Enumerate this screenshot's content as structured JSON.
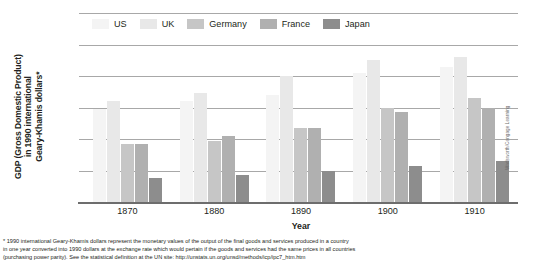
{
  "chart_data": {
    "type": "bar",
    "title": "",
    "xlabel": "Year",
    "ylabel": "GDP (Gross Domestic Product) in 1990 international Geary-Khamis dollars*",
    "categories": [
      "1870",
      "1880",
      "1890",
      "1900",
      "1910"
    ],
    "ylim": [
      0,
      6000
    ],
    "yticks": [
      "0",
      "1000",
      "2000",
      "3000",
      "4000",
      "5000",
      "6000"
    ],
    "grid": true,
    "legend_position": "top",
    "series": [
      {
        "name": "US",
        "color": "#f4f4f4",
        "values": [
          2950,
          3200,
          3400,
          4100,
          4300
        ]
      },
      {
        "name": "UK",
        "color": "#e8e8e8",
        "values": [
          3200,
          3450,
          4000,
          4500,
          4600
        ]
      },
      {
        "name": "Germany",
        "color": "#c6c6c6",
        "values": [
          1850,
          1950,
          2350,
          3000,
          3300
        ]
      },
      {
        "name": "France",
        "color": "#b0b0b0",
        "values": [
          1850,
          2100,
          2350,
          2850,
          3000
        ]
      },
      {
        "name": "Japan",
        "color": "#8d8d8d",
        "values": [
          750,
          850,
          1000,
          1150,
          1300
        ]
      }
    ]
  },
  "axis": {
    "y_title": "GDP (Gross Domestic Product)\nin 1990 international\nGeary-Khamis dollars*",
    "y_title_line1": "GDP (Gross Domestic Product)",
    "y_title_line2": "in 1990 international",
    "y_title_line3": "Geary-Khamis dollars*",
    "x_title": "Year"
  },
  "footnote": {
    "line1": "* 1990 international Geary-Khamis dollars represent the monetary values of the output of the final goods and services produced in a country",
    "line2": "in one year converted into 1990 dollars at the exchange rate which would pertain if the goods and services had the same prices in all countries",
    "line3": "(purchasing power parity). See the statistical definition at the UN site: http://unstats.un.org/unsd/methods/icp/ipc7_htm.htm"
  },
  "credit": {
    "text": "Wadsworth/Cengage Learning"
  }
}
